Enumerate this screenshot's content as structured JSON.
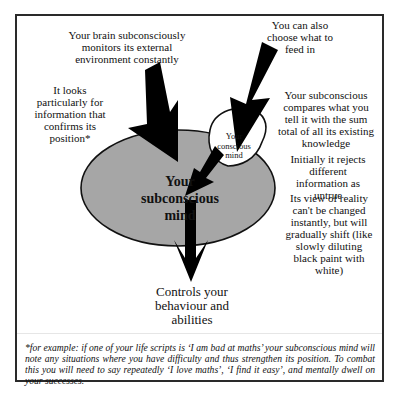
{
  "diagram": {
    "labels": {
      "brain_monitors": "Your brain subconsciously monitors its external environment constantly",
      "looks_for": "It looks particularly for information that confirms its position*",
      "choose_feed": "You can also choose what to feed in",
      "compares": "Your subconscious compares what you tell it with the sum total of all its existing knowledge",
      "rejects": "Initially it rejects different information as untrue",
      "view_reality": "Its view of reality can't be changed instantly, but will gradually shift (like slowly diluting black paint with white)",
      "controls": "Controls your behaviour and abilities"
    },
    "nodes": {
      "subconscious": "Your subconscious mind",
      "conscious": "Your conscious mind"
    },
    "colors": {
      "subconscious_fill": "#a6a6a6",
      "conscious_fill": "#ffffff",
      "arrow": "#000000",
      "border": "#2a2a2a"
    },
    "footnote": "*for example: if one of your life scripts is ‘I am bad at maths’ your subconscious mind will note any situations where you have difficulty and thus strengthen its position. To combat this you will need to say repeatedly ‘I love maths’, ‘I find it easy’, and mentally dwell on your successes."
  }
}
